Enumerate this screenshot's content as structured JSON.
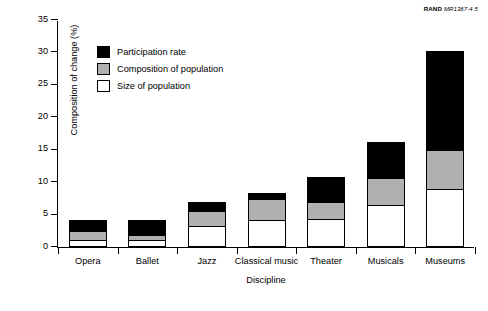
{
  "credit": {
    "org": "RAND",
    "doc_id": "MR1367-4.5"
  },
  "chart_data": {
    "type": "bar",
    "subtype": "stacked",
    "title": "",
    "xlabel": "Discipline",
    "ylabel": "Composition of change (%)",
    "ylim": [
      0,
      35
    ],
    "yticks": [
      0,
      5,
      10,
      15,
      20,
      25,
      30,
      35
    ],
    "ytick_labels": [
      "0",
      "5",
      "10",
      "15",
      "20",
      "25",
      "30",
      "35"
    ],
    "grid": false,
    "legend_position": "upper left inside",
    "categories": [
      "Opera",
      "Ballet",
      "Jazz",
      "Classical music",
      "Theater",
      "Musicals",
      "Museums"
    ],
    "series": [
      {
        "name": "Size of population",
        "color": "#ffffff",
        "values": [
          1.1,
          1.1,
          3.2,
          4.1,
          4.3,
          6.5,
          9.0
        ]
      },
      {
        "name": "Composition of population",
        "color": "#b0b0b0",
        "values": [
          1.3,
          0.7,
          2.3,
          3.3,
          2.7,
          4.1,
          6.0
        ]
      },
      {
        "name": "Participation rate",
        "color": "#000000",
        "values": [
          1.7,
          2.4,
          1.5,
          1.0,
          3.8,
          5.6,
          15.2
        ]
      }
    ],
    "totals": [
      4.1,
      4.2,
      7.0,
      8.4,
      10.8,
      16.2,
      30.2
    ]
  }
}
